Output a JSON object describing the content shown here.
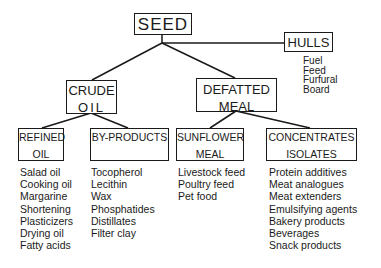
{
  "diagram": {
    "root": {
      "label": "SEED"
    },
    "hulls": {
      "label": "HULLS",
      "uses": [
        "Fuel",
        "Feed",
        "Furfural",
        "Board"
      ]
    },
    "crude_oil": {
      "line1": "CRUDE",
      "line2": "OIL"
    },
    "defatted_meal": {
      "line1": "DEFATTED",
      "line2": "MEAL"
    },
    "refined_oil": {
      "line1": "REFINED",
      "line2": "OIL",
      "uses": [
        "Salad oil",
        "Cooking oil",
        "Margarine",
        "Shortening",
        "Plasticizers",
        "Drying oil",
        "Fatty acids"
      ]
    },
    "by_products": {
      "line1": "BY-PRODUCTS",
      "line2": "",
      "uses": [
        "Tocopherol",
        "Lecithin",
        "Wax",
        "Phosphatides",
        "Distillates",
        "Filter clay"
      ]
    },
    "sunflower_meal": {
      "line1": "SUNFLOWER",
      "line2": "MEAL",
      "uses": [
        "Livestock feed",
        "Poultry feed",
        "Pet food"
      ]
    },
    "concentrates_isolates": {
      "line1": "CONCENTRATES",
      "line2": "ISOLATES",
      "uses": [
        "Protein additives",
        "Meat analogues",
        "Meat extenders",
        "Emulsifying agents",
        "Bakery products",
        "Beverages",
        "Snack products"
      ]
    }
  }
}
